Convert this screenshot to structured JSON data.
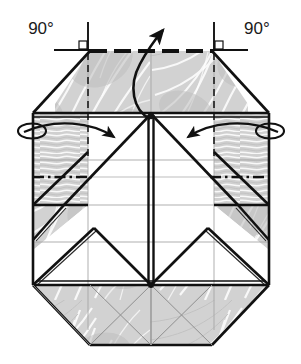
{
  "figure": {
    "type": "origami-diagram",
    "width": 301,
    "height": 364
  },
  "annotations": {
    "angle_left": {
      "label": "90°",
      "name": "angle-label-left",
      "x": 60,
      "y": 40
    },
    "angle_right": {
      "label": "90°",
      "name": "angle-label-right",
      "x": 240,
      "y": 40
    }
  },
  "arrows": [
    {
      "name": "pull-up-arrow",
      "kind": "curved-fold-arrow",
      "direction": "up",
      "from": [
        148,
        117
      ],
      "to": [
        168,
        32
      ]
    },
    {
      "name": "fold-in-arrow-left",
      "kind": "curved-fold-arrow",
      "direction": "right-inward",
      "from": [
        42,
        130
      ],
      "to": [
        117,
        140
      ]
    },
    {
      "name": "fold-in-arrow-right",
      "kind": "curved-fold-arrow",
      "direction": "left-inward",
      "from": [
        258,
        130
      ],
      "to": [
        186,
        140
      ]
    },
    {
      "name": "roll-loop-left",
      "kind": "ellipse-wrap",
      "cx": 33,
      "cy": 131
    },
    {
      "name": "roll-loop-right",
      "kind": "ellipse-wrap",
      "cx": 268,
      "cy": 131
    }
  ],
  "colors": {
    "ink": "#111111",
    "paper_shade": "#cdcdcd",
    "paper_shade_light": "#dedede",
    "paper_white": "#ffffff",
    "crease_thin": "#9a9a9a",
    "background": "#ffffff"
  },
  "geometry": {
    "outline": "Octagonal folded sheet with chamfered top-left, top-right, bottom-left, bottom-right corners",
    "top_edge_dashed": true,
    "center_line_horizontal": "dash-dot",
    "center_line_vertical": "double-bold"
  },
  "legend": {
    "mountain_fold": "dash-dot line",
    "valley_fold": "dashed line",
    "edge": "solid bold line",
    "existing_crease": "thin gray line"
  }
}
